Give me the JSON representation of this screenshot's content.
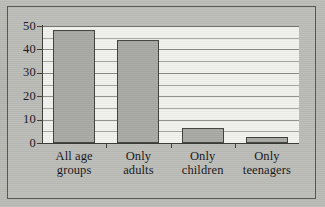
{
  "chart_data": {
    "type": "bar",
    "title": "",
    "subtitle": "",
    "xlabel": "",
    "ylabel": "",
    "categories": [
      "All age groups",
      "Only adults",
      "Only children",
      "Only teenagers"
    ],
    "category_lines": [
      [
        "All age",
        "groups"
      ],
      [
        "Only",
        "adults"
      ],
      [
        "Only",
        "children"
      ],
      [
        "Only",
        "teenagers"
      ]
    ],
    "values": [
      48.5,
      44,
      6.5,
      2.5
    ],
    "ylim": [
      0,
      50
    ],
    "ytick_labels": [
      "0",
      "10",
      "20",
      "30",
      "40",
      "50"
    ],
    "ytick_values": [
      0,
      10,
      20,
      30,
      40,
      50
    ],
    "minor_gridline_values": [
      5,
      15,
      25,
      35,
      45
    ],
    "grid": true,
    "legend": "none",
    "bar_color": "#a9a9a5",
    "bar_edge_color": "#3e3e3a",
    "plot_background": "#f2f2ef",
    "axis_color": "#3b3b37",
    "frame_color": "#54544f",
    "page_background": "#b9b9b4"
  }
}
